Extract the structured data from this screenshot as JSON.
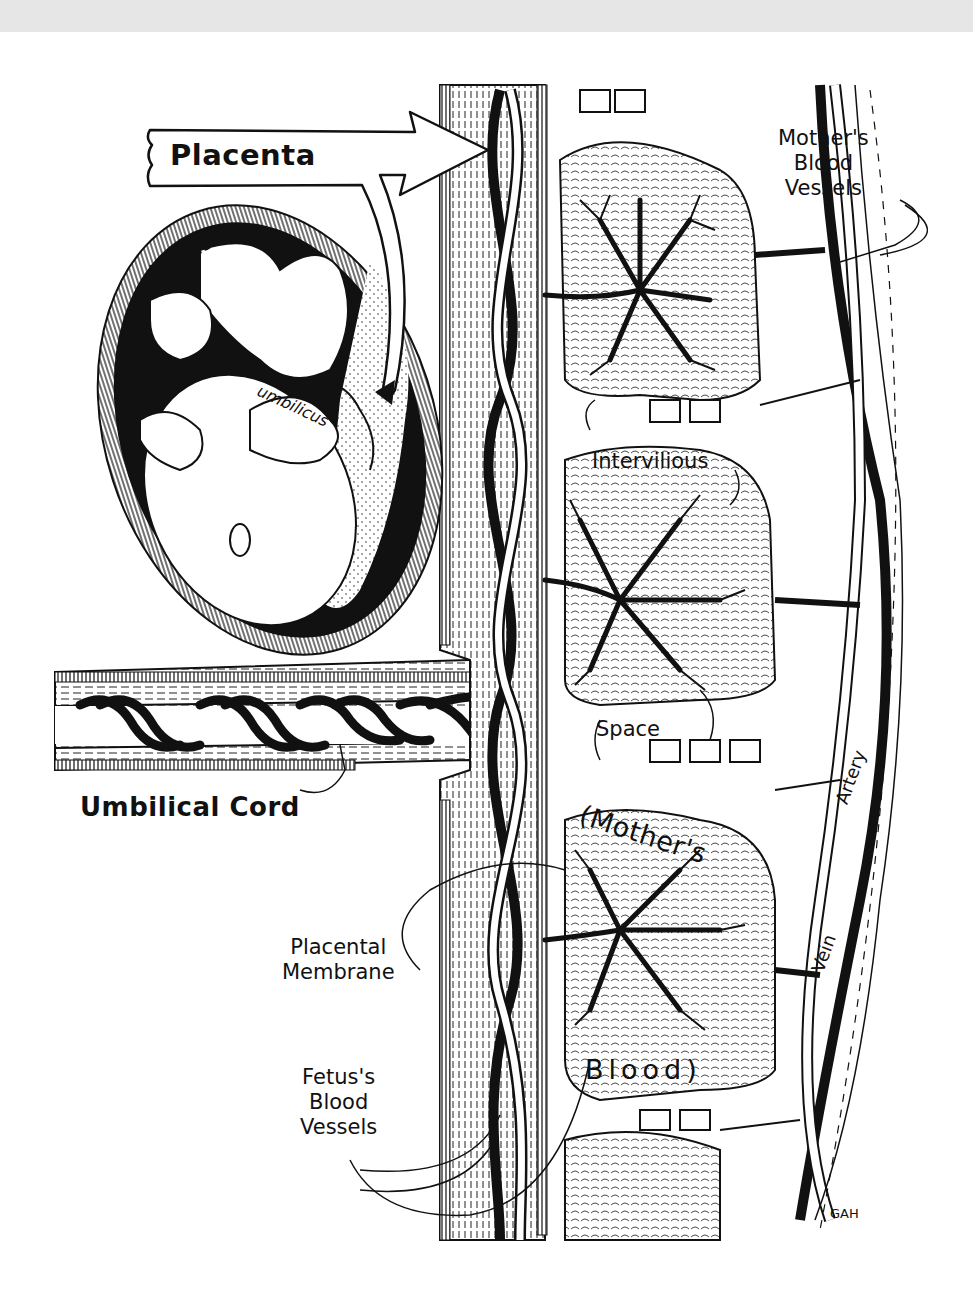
{
  "figure": {
    "title": "Placenta",
    "background": "#ffffff",
    "ink_color": "#111111",
    "top_band_color": "#e6e6e6",
    "signature": "GAH"
  },
  "labels": {
    "placenta": "Placenta",
    "uterus": "Uterus",
    "umbilicus": "umbilicus",
    "mothers_blood_vessels": [
      "Mother's",
      "Blood",
      "Vessels"
    ],
    "intervilious": "Intervilious",
    "space": "Space",
    "mothers": "(Mother's",
    "blood": "Blood)",
    "umbilical_cord": "Umbilical Cord",
    "placental_membrane": [
      "Placental",
      "Membrane"
    ],
    "fetus_blood_vessels": [
      "Fetus's",
      "Blood",
      "Vessels"
    ],
    "artery": "Artery",
    "vein": "Vein"
  },
  "structures": [
    {
      "name": "uterus",
      "description": "oval uterus with fetus inside"
    },
    {
      "name": "umbilical-cord",
      "description": "horizontal cord with spiraling vessels"
    },
    {
      "name": "placental-wall",
      "description": "vertical hatched band with twisting fetal vessels"
    },
    {
      "name": "villi",
      "description": "three branching villous trees in intervillous space"
    },
    {
      "name": "maternal-vessels",
      "description": "artery and vein on right side"
    }
  ]
}
